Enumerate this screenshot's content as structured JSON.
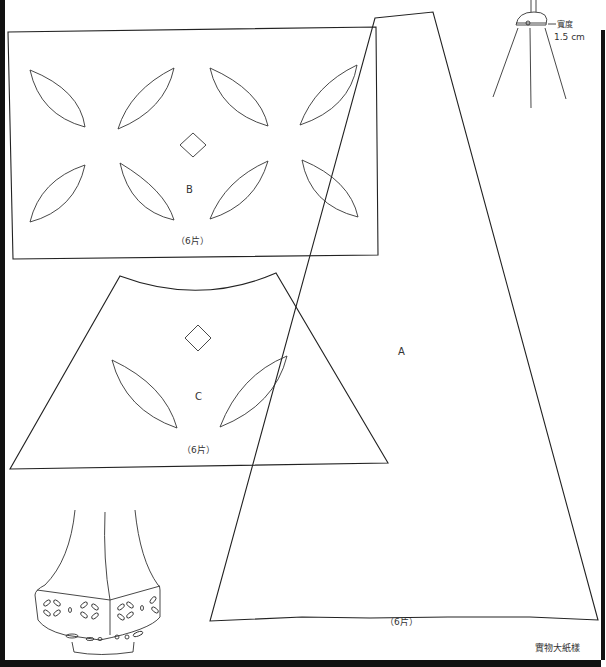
{
  "pieces": {
    "A": {
      "label": "A",
      "count": "（6片）"
    },
    "B": {
      "label": "B",
      "count": "（6片）"
    },
    "C": {
      "label": "C",
      "count": "（6片）"
    }
  },
  "frame_detail": {
    "width_label": "寬度",
    "width_value": "1.5 cm"
  },
  "footer_note": "實物大紙樣",
  "colors": {
    "line": "#222222",
    "border": "#111111",
    "background": "#ffffff"
  }
}
